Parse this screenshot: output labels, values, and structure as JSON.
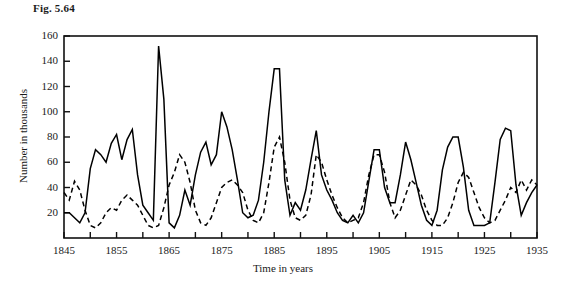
{
  "figure": {
    "caption": "Fig. 5.64"
  },
  "chart_data": {
    "type": "line",
    "title": "Fig. 5.64",
    "xlabel": "Time in years",
    "ylabel": "Number in thousands",
    "xlim": [
      1845,
      1935
    ],
    "ylim": [
      0,
      160
    ],
    "grid": false,
    "legend": null,
    "y_ticks": [
      20,
      40,
      60,
      80,
      100,
      120,
      140,
      160
    ],
    "x_ticks": [
      1845,
      1850,
      1855,
      1860,
      1865,
      1870,
      1875,
      1880,
      1885,
      1890,
      1895,
      1900,
      1905,
      1910,
      1915,
      1920,
      1925,
      1930,
      1935
    ],
    "x_tick_labels": [
      "1845",
      "",
      "1855",
      "",
      "1865",
      "",
      "1875",
      "",
      "1885",
      "",
      "1895",
      "",
      "1905",
      "",
      "1915",
      "",
      "1925",
      "",
      "1935"
    ],
    "x_minor_tick_interval": 5,
    "x": [
      1845,
      1846,
      1847,
      1848,
      1849,
      1850,
      1851,
      1852,
      1853,
      1854,
      1855,
      1856,
      1857,
      1858,
      1859,
      1860,
      1861,
      1862,
      1863,
      1864,
      1865,
      1866,
      1867,
      1868,
      1869,
      1870,
      1871,
      1872,
      1873,
      1874,
      1875,
      1876,
      1877,
      1878,
      1879,
      1880,
      1881,
      1882,
      1883,
      1884,
      1885,
      1886,
      1887,
      1888,
      1889,
      1890,
      1891,
      1892,
      1893,
      1894,
      1895,
      1896,
      1897,
      1898,
      1899,
      1900,
      1901,
      1902,
      1903,
      1904,
      1905,
      1906,
      1907,
      1908,
      1909,
      1910,
      1911,
      1912,
      1913,
      1914,
      1915,
      1916,
      1917,
      1918,
      1919,
      1920,
      1921,
      1922,
      1923,
      1924,
      1925,
      1926,
      1927,
      1928,
      1929,
      1930,
      1931,
      1932,
      1933,
      1934,
      1935
    ],
    "series": [
      {
        "name": "solid-series",
        "style": "solid",
        "color": "#000000",
        "values": [
          20,
          20,
          52,
          83,
          64,
          68,
          83,
          12,
          36,
          150,
          110,
          60,
          7,
          10,
          70,
          100,
          92,
          70,
          10,
          11,
          137,
          137,
          18,
          22,
          52,
          83,
          18,
          10,
          9,
          65,
          18,
          20,
          12,
          13,
          10,
          17,
          26,
          23,
          43,
          20,
          10,
          18,
          33,
          28,
          45,
          22,
          21,
          9,
          6,
          21,
          16,
          14,
          15,
          18,
          16,
          17,
          17,
          12,
          10,
          8,
          6,
          8,
          10,
          11,
          8,
          8,
          8,
          8,
          8,
          8,
          8,
          8,
          8,
          8,
          8,
          8,
          8,
          8,
          8,
          8,
          8,
          8,
          8,
          8,
          8,
          8,
          8,
          8,
          8,
          8,
          8
        ]
      }
    ],
    "hare_values": [
      20,
      20,
      52,
      83,
      64,
      68,
      83,
      12,
      36,
      150,
      110,
      60,
      7,
      10,
      70,
      100,
      92,
      70,
      10,
      11,
      137,
      137,
      18,
      22,
      52,
      83,
      18,
      10,
      9,
      65,
      18,
      20,
      12,
      13,
      10,
      17,
      26,
      23,
      43,
      20,
      10,
      18,
      33,
      28,
      45,
      22,
      21,
      9,
      6,
      21,
      16,
      14,
      15,
      18,
      16,
      17,
      17,
      12,
      10,
      8,
      6,
      8,
      10,
      11,
      8,
      8,
      8,
      8,
      8,
      8,
      8,
      8,
      8,
      8,
      8,
      8,
      8,
      8,
      8,
      8,
      8,
      8,
      8,
      8,
      8,
      8,
      8,
      8,
      8,
      8,
      8
    ],
    "solid_line": {
      "name": "Snowshoe hare",
      "linestyle": "solid",
      "points": [
        [
          1845,
          20
        ],
        [
          1846,
          20
        ],
        [
          1847,
          16
        ],
        [
          1848,
          12
        ],
        [
          1849,
          20
        ],
        [
          1850,
          55
        ],
        [
          1851,
          70
        ],
        [
          1852,
          66
        ],
        [
          1853,
          60
        ],
        [
          1854,
          75
        ],
        [
          1855,
          82
        ],
        [
          1856,
          62
        ],
        [
          1857,
          78
        ],
        [
          1858,
          86
        ],
        [
          1859,
          50
        ],
        [
          1860,
          26
        ],
        [
          1861,
          20
        ],
        [
          1862,
          14
        ],
        [
          1863,
          152
        ],
        [
          1864,
          110
        ],
        [
          1865,
          12
        ],
        [
          1866,
          8
        ],
        [
          1867,
          18
        ],
        [
          1868,
          38
        ],
        [
          1869,
          26
        ],
        [
          1870,
          50
        ],
        [
          1871,
          68
        ],
        [
          1872,
          76
        ],
        [
          1873,
          58
        ],
        [
          1874,
          66
        ],
        [
          1875,
          100
        ],
        [
          1876,
          88
        ],
        [
          1877,
          70
        ],
        [
          1878,
          46
        ],
        [
          1879,
          20
        ],
        [
          1880,
          16
        ],
        [
          1881,
          18
        ],
        [
          1882,
          30
        ],
        [
          1883,
          60
        ],
        [
          1884,
          100
        ],
        [
          1885,
          134
        ],
        [
          1886,
          134
        ],
        [
          1887,
          46
        ],
        [
          1888,
          18
        ],
        [
          1889,
          28
        ],
        [
          1890,
          22
        ],
        [
          1891,
          38
        ],
        [
          1892,
          62
        ],
        [
          1893,
          85
        ],
        [
          1894,
          50
        ],
        [
          1895,
          38
        ],
        [
          1896,
          30
        ],
        [
          1897,
          20
        ],
        [
          1898,
          14
        ],
        [
          1899,
          12
        ],
        [
          1900,
          18
        ],
        [
          1901,
          12
        ],
        [
          1902,
          20
        ],
        [
          1903,
          45
        ],
        [
          1904,
          70
        ],
        [
          1905,
          70
        ],
        [
          1906,
          40
        ],
        [
          1907,
          28
        ],
        [
          1908,
          28
        ],
        [
          1909,
          50
        ],
        [
          1910,
          76
        ],
        [
          1911,
          62
        ],
        [
          1912,
          44
        ],
        [
          1913,
          26
        ],
        [
          1914,
          14
        ],
        [
          1915,
          10
        ],
        [
          1916,
          22
        ],
        [
          1917,
          54
        ],
        [
          1918,
          72
        ],
        [
          1919,
          80
        ],
        [
          1920,
          80
        ],
        [
          1921,
          56
        ],
        [
          1922,
          22
        ],
        [
          1923,
          10
        ],
        [
          1924,
          10
        ],
        [
          1925,
          10
        ],
        [
          1926,
          12
        ],
        [
          1927,
          44
        ],
        [
          1928,
          78
        ],
        [
          1929,
          87
        ],
        [
          1930,
          85
        ],
        [
          1931,
          42
        ],
        [
          1932,
          18
        ],
        [
          1933,
          28
        ],
        [
          1934,
          36
        ],
        [
          1935,
          42
        ]
      ]
    },
    "dashed_line": {
      "name": "Canada lynx",
      "linestyle": "dashed",
      "points": [
        [
          1845,
          36
        ],
        [
          1846,
          30
        ],
        [
          1847,
          45
        ],
        [
          1848,
          38
        ],
        [
          1849,
          22
        ],
        [
          1850,
          10
        ],
        [
          1851,
          8
        ],
        [
          1852,
          12
        ],
        [
          1853,
          20
        ],
        [
          1854,
          24
        ],
        [
          1855,
          22
        ],
        [
          1856,
          30
        ],
        [
          1857,
          34
        ],
        [
          1858,
          30
        ],
        [
          1859,
          26
        ],
        [
          1860,
          18
        ],
        [
          1861,
          10
        ],
        [
          1862,
          8
        ],
        [
          1863,
          10
        ],
        [
          1864,
          24
        ],
        [
          1865,
          42
        ],
        [
          1866,
          52
        ],
        [
          1867,
          66
        ],
        [
          1868,
          60
        ],
        [
          1869,
          44
        ],
        [
          1870,
          22
        ],
        [
          1871,
          12
        ],
        [
          1872,
          10
        ],
        [
          1873,
          16
        ],
        [
          1874,
          28
        ],
        [
          1875,
          40
        ],
        [
          1876,
          44
        ],
        [
          1877,
          46
        ],
        [
          1878,
          42
        ],
        [
          1879,
          36
        ],
        [
          1880,
          22
        ],
        [
          1881,
          14
        ],
        [
          1882,
          12
        ],
        [
          1883,
          20
        ],
        [
          1884,
          44
        ],
        [
          1885,
          72
        ],
        [
          1886,
          80
        ],
        [
          1887,
          60
        ],
        [
          1888,
          30
        ],
        [
          1889,
          16
        ],
        [
          1890,
          14
        ],
        [
          1891,
          18
        ],
        [
          1892,
          34
        ],
        [
          1893,
          66
        ],
        [
          1894,
          60
        ],
        [
          1895,
          46
        ],
        [
          1896,
          34
        ],
        [
          1897,
          24
        ],
        [
          1898,
          16
        ],
        [
          1899,
          12
        ],
        [
          1900,
          14
        ],
        [
          1901,
          16
        ],
        [
          1902,
          28
        ],
        [
          1903,
          50
        ],
        [
          1904,
          66
        ],
        [
          1905,
          66
        ],
        [
          1906,
          52
        ],
        [
          1907,
          28
        ],
        [
          1908,
          16
        ],
        [
          1909,
          22
        ],
        [
          1910,
          34
        ],
        [
          1911,
          46
        ],
        [
          1912,
          42
        ],
        [
          1913,
          34
        ],
        [
          1914,
          22
        ],
        [
          1915,
          14
        ],
        [
          1916,
          10
        ],
        [
          1917,
          10
        ],
        [
          1918,
          16
        ],
        [
          1919,
          28
        ],
        [
          1920,
          44
        ],
        [
          1921,
          52
        ],
        [
          1922,
          48
        ],
        [
          1923,
          36
        ],
        [
          1924,
          24
        ],
        [
          1925,
          16
        ],
        [
          1926,
          12
        ],
        [
          1927,
          14
        ],
        [
          1928,
          22
        ],
        [
          1929,
          30
        ],
        [
          1930,
          40
        ],
        [
          1931,
          36
        ],
        [
          1932,
          46
        ],
        [
          1933,
          38
        ],
        [
          1934,
          46
        ],
        [
          1935,
          42
        ]
      ]
    }
  }
}
